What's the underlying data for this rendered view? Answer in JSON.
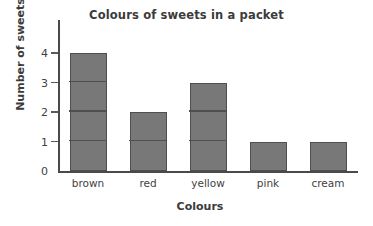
{
  "chart_data": {
    "type": "bar",
    "title": "Colours of sweets in a packet",
    "xlabel": "Colours",
    "ylabel": "Number of sweets",
    "categories": [
      "brown",
      "red",
      "yellow",
      "pink",
      "cream"
    ],
    "values": [
      4,
      2,
      3,
      1,
      1
    ],
    "ytick_labels": [
      "0",
      "1",
      "2",
      "3",
      "4"
    ],
    "ylim": [
      0,
      5
    ],
    "ytick_values": [
      0,
      1,
      2,
      3,
      4
    ],
    "grid": "unit-gridlines-inside-bars",
    "legend": "none",
    "bar_color": "#787878",
    "bar_edge_color": "#4f4f4f",
    "axis_color": "#4a4a4a",
    "text_color": "#3b3b3b",
    "background_color": "#ffffff"
  }
}
